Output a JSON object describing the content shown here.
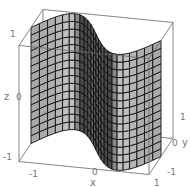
{
  "chart_data": {
    "type": "surface3d",
    "title": "",
    "surface": {
      "equation": "y = -sin(pi * x)",
      "x_range": [
        -1,
        1
      ],
      "z_range": [
        -1,
        1
      ],
      "mesh_x_divisions": 24,
      "mesh_z_divisions": 15,
      "face_color": "#a8a8a8",
      "mesh_color": "#111111"
    },
    "axes": {
      "x": {
        "label": "x",
        "range": [
          -1,
          1
        ],
        "ticks": [
          "-1",
          "0",
          "1"
        ]
      },
      "y": {
        "label": "y",
        "range": [
          -1,
          1
        ],
        "ticks": [
          "-1",
          "0",
          "1"
        ]
      },
      "z": {
        "label": "z",
        "range": [
          -1,
          1
        ],
        "ticks": [
          "-1",
          "0",
          "1"
        ]
      }
    },
    "box": true,
    "frame_color": "#666666"
  }
}
